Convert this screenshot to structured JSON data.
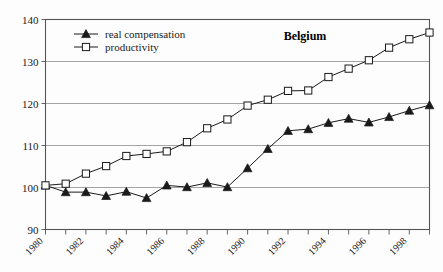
{
  "chart_data": {
    "type": "line",
    "title": "Belgium",
    "xlabel": "",
    "ylabel": "",
    "xlim": [
      1980,
      1999
    ],
    "ylim": [
      90,
      140
    ],
    "yticks": [
      90,
      100,
      110,
      120,
      130,
      140
    ],
    "xticks": [
      1980,
      1982,
      1984,
      1986,
      1988,
      1990,
      1992,
      1994,
      1996,
      1998
    ],
    "xtick_labels": [
      "1980",
      "1982",
      "1984",
      "1986",
      "1988",
      "1990",
      "1992",
      "1994",
      "1996",
      "1998"
    ],
    "grid": "horizontal",
    "legend_position": "top-left",
    "x": [
      1980,
      1981,
      1982,
      1983,
      1984,
      1985,
      1986,
      1987,
      1988,
      1989,
      1990,
      1991,
      1992,
      1993,
      1994,
      1995,
      1996,
      1997,
      1998,
      1999
    ],
    "series": [
      {
        "name": "real compensation",
        "marker": "filled-triangle",
        "values": [
          100.5,
          98.9,
          98.9,
          98.0,
          99.0,
          97.5,
          100.5,
          100.1,
          101.1,
          100.1,
          104.6,
          109.2,
          113.5,
          113.9,
          115.4,
          116.4,
          115.5,
          116.8,
          118.3,
          119.6
        ]
      },
      {
        "name": "productivity",
        "marker": "open-square",
        "values": [
          100.5,
          100.9,
          103.3,
          105.1,
          107.5,
          108.0,
          108.6,
          110.8,
          114.1,
          116.2,
          119.5,
          120.9,
          123.0,
          123.1,
          126.3,
          128.3,
          130.3,
          133.3,
          135.3,
          136.9
        ]
      }
    ],
    "colors": {
      "line": "#1a1a1a",
      "grid": "#8d8d8d",
      "frame": "#555555",
      "background": "#fdfdfd",
      "marker_fill_compensation": "#1a1a1a",
      "marker_fill_productivity": "#ffffff"
    }
  },
  "legend": {
    "items": [
      {
        "label": "real compensation",
        "marker": "filled-triangle"
      },
      {
        "label": "productivity",
        "marker": "open-square"
      }
    ]
  }
}
